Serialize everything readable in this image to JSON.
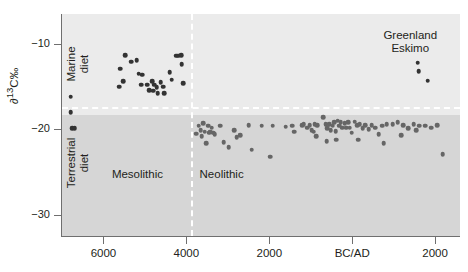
{
  "chart_data": {
    "type": "scatter",
    "title": "",
    "xlabel": "",
    "ylabel": "∂¹³C‰",
    "ylabel_parts": {
      "delta": "∂",
      "sup": "13",
      "rest": "C‰"
    },
    "xlim": [
      7000,
      -2600
    ],
    "ylim": [
      -32.5,
      -6.5
    ],
    "grid": false,
    "legend_position": "none",
    "x_tick_values": [
      6000,
      4000,
      2000,
      0,
      -2000
    ],
    "x_tick_labels": [
      "6000",
      "4000",
      "2000",
      "BC/AD",
      "2000"
    ],
    "y_tick_values": [
      -10,
      -20,
      -30
    ],
    "y_tick_labels": [
      "−10",
      "−20",
      "−30"
    ],
    "annotations": [
      {
        "name": "marine-diet",
        "text_line1": "Marine",
        "text_line2": "diet",
        "x": 6630,
        "y": -12.3,
        "rotated": true
      },
      {
        "name": "terrestrial-diet",
        "text_line1": "Terrestrial",
        "text_line2": "diet",
        "x": 6630,
        "y": -24.0,
        "rotated": true
      },
      {
        "name": "mesolithic",
        "text_line1": "Mesolithic",
        "text_line2": "",
        "x": 5180,
        "y": -25.4,
        "rotated": false
      },
      {
        "name": "neolithic",
        "text_line1": "Neolithic",
        "text_line2": "",
        "x": 3150,
        "y": -25.4,
        "rotated": false
      },
      {
        "name": "greenland-eskimo",
        "text_line1": "Greenland",
        "text_line2": "Eskimo",
        "x": -1400,
        "y": -9.1,
        "rotated": false
      }
    ],
    "reference_lines": [
      {
        "name": "diet-boundary",
        "orientation": "horizontal",
        "value": -17.4,
        "style": "dashed",
        "color": "#ffffff"
      },
      {
        "name": "period-boundary",
        "orientation": "vertical",
        "value": 3900,
        "style": "dashed",
        "color": "#ffffff"
      }
    ],
    "bands": [
      {
        "name": "marine-band",
        "y_range": [
          -6.5,
          -17.4
        ],
        "color": "#ebebeb"
      },
      {
        "name": "terrestrial-band",
        "y_range": [
          -17.4,
          -32.5
        ],
        "color": "#d6d6d6"
      }
    ],
    "series": [
      {
        "name": "Mesolithic marine",
        "color": "#333333",
        "marker": "circle",
        "size": 4.6,
        "points": [
          [
            6790,
            -16.2
          ],
          [
            6790,
            -18.0
          ],
          [
            6760,
            -19.9
          ],
          [
            6690,
            -19.9
          ],
          [
            5590,
            -12.9
          ],
          [
            5470,
            -11.3
          ],
          [
            5330,
            -12.1
          ],
          [
            5200,
            -11.9
          ],
          [
            5150,
            -13.5
          ],
          [
            5090,
            -14.8
          ],
          [
            5060,
            -13.6
          ],
          [
            4940,
            -14.8
          ],
          [
            4900,
            -15.4
          ],
          [
            4830,
            -14.4
          ],
          [
            4800,
            -15.5
          ],
          [
            4770,
            -14.8
          ],
          [
            4720,
            -15.1
          ],
          [
            4690,
            -15.8
          ],
          [
            4620,
            -14.5
          ],
          [
            4560,
            -15.0
          ],
          [
            4530,
            -15.8
          ],
          [
            4400,
            -13.3
          ],
          [
            4350,
            -14.2
          ],
          [
            4240,
            -11.4
          ],
          [
            4190,
            -11.4
          ],
          [
            4120,
            -11.3
          ],
          [
            4110,
            -12.4
          ],
          [
            4070,
            -14.6
          ],
          [
            5620,
            -15.0
          ],
          [
            5530,
            -14.4
          ]
        ]
      },
      {
        "name": "Neolithic and later terrestrial",
        "color": "#666666",
        "marker": "circle",
        "size": 4.6,
        "points": [
          [
            3760,
            -20.5
          ],
          [
            3700,
            -19.6
          ],
          [
            3650,
            -20.1
          ],
          [
            3630,
            -20.8
          ],
          [
            3590,
            -19.3
          ],
          [
            3560,
            -20.3
          ],
          [
            3520,
            -21.6
          ],
          [
            3480,
            -19.6
          ],
          [
            3450,
            -20.4
          ],
          [
            3420,
            -20.3
          ],
          [
            3390,
            -19.8
          ],
          [
            3350,
            -20.4
          ],
          [
            3320,
            -20.6
          ],
          [
            3180,
            -19.6
          ],
          [
            3100,
            -21.5
          ],
          [
            2980,
            -22.1
          ],
          [
            2700,
            -20.7
          ],
          [
            2500,
            -19.5
          ],
          [
            2180,
            -19.6
          ],
          [
            1920,
            -19.6
          ],
          [
            1600,
            -19.7
          ],
          [
            1450,
            -19.6
          ],
          [
            1400,
            -20.3
          ],
          [
            1210,
            -19.5
          ],
          [
            1170,
            -19.4
          ],
          [
            1080,
            -19.8
          ],
          [
            1030,
            -19.5
          ],
          [
            980,
            -20.1
          ],
          [
            930,
            -20.3
          ],
          [
            900,
            -19.4
          ],
          [
            870,
            -20.8
          ],
          [
            840,
            -19.5
          ],
          [
            700,
            -18.6
          ],
          [
            640,
            -19.4
          ],
          [
            600,
            -19.9
          ],
          [
            560,
            -19.4
          ],
          [
            520,
            -20.1
          ],
          [
            470,
            -19.6
          ],
          [
            430,
            -19.2
          ],
          [
            400,
            -20.2
          ],
          [
            350,
            -19.0
          ],
          [
            320,
            -19.6
          ],
          [
            280,
            -19.2
          ],
          [
            240,
            -19.8
          ],
          [
            180,
            -19.3
          ],
          [
            150,
            -19.8
          ],
          [
            100,
            -19.2
          ],
          [
            60,
            -19.8
          ],
          [
            10,
            -20.4
          ],
          [
            -60,
            -19.1
          ],
          [
            -120,
            -19.5
          ],
          [
            -180,
            -19.4
          ],
          [
            -250,
            -19.9
          ],
          [
            -320,
            -19.5
          ],
          [
            -400,
            -20.0
          ],
          [
            -470,
            -19.5
          ],
          [
            -560,
            -19.8
          ],
          [
            -640,
            -20.6
          ],
          [
            -720,
            -19.6
          ],
          [
            -830,
            -19.4
          ],
          [
            -980,
            -19.4
          ],
          [
            -1100,
            -19.2
          ],
          [
            -1230,
            -19.5
          ],
          [
            -1350,
            -19.9
          ],
          [
            -1480,
            -19.4
          ],
          [
            -1550,
            -20.1
          ],
          [
            -1620,
            -19.6
          ],
          [
            -1760,
            -19.6
          ],
          [
            -1900,
            -19.8
          ],
          [
            -2050,
            -19.5
          ],
          [
            2420,
            -22.4
          ],
          [
            1980,
            -23.2
          ],
          [
            620,
            -21.4
          ],
          [
            380,
            -21.2
          ],
          [
            -140,
            -21.2
          ],
          [
            -760,
            -21.6
          ],
          [
            -1180,
            -20.7
          ],
          [
            -2180,
            -22.9
          ],
          [
            2850,
            -20.1
          ],
          [
            2790,
            -20.9
          ]
        ]
      },
      {
        "name": "Greenland Eskimo",
        "color": "#333333",
        "marker": "circle",
        "size": 4.6,
        "points": [
          [
            -1580,
            -12.2
          ],
          [
            -1600,
            -13.2
          ],
          [
            -1820,
            -14.3
          ]
        ]
      }
    ]
  }
}
